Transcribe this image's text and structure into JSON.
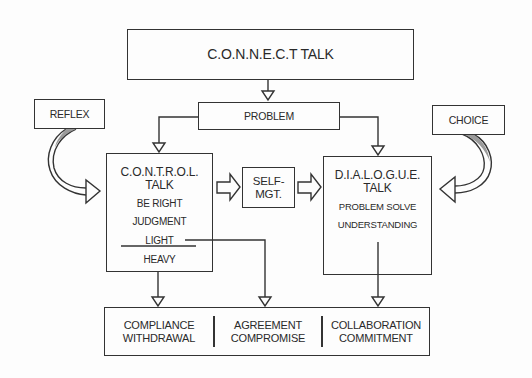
{
  "diagram": {
    "top": {
      "label": "C.O.N.N.E.C.T TALK"
    },
    "problem": {
      "label": "PROBLEM"
    },
    "reflex": {
      "label": "REFLEX"
    },
    "choice": {
      "label": "CHOICE"
    },
    "control": {
      "title_line1": "C.O.N.T.R.O.L.",
      "title_line2": "TALK",
      "items": [
        "BE RIGHT",
        "JUDGMENT",
        "LIGHT",
        "HEAVY"
      ]
    },
    "self_mgt": {
      "line1": "SELF-",
      "line2": "MGT."
    },
    "dialogue": {
      "title_line1": "D.I.A.L.O.G.U.E.",
      "title_line2": "TALK",
      "items": [
        "PROBLEM SOLVE",
        "UNDERSTANDING"
      ]
    },
    "outcomes": [
      {
        "line1": "COMPLIANCE",
        "line2": "WITHDRAWAL"
      },
      {
        "line1": "AGREEMENT",
        "line2": "COMPROMISE"
      },
      {
        "line1": "COLLABORATION",
        "line2": "COMMITMENT"
      }
    ],
    "colors": {
      "stroke": "#333333",
      "background": "#fdfdfd",
      "curve_shade": "#8a8a8a"
    }
  }
}
